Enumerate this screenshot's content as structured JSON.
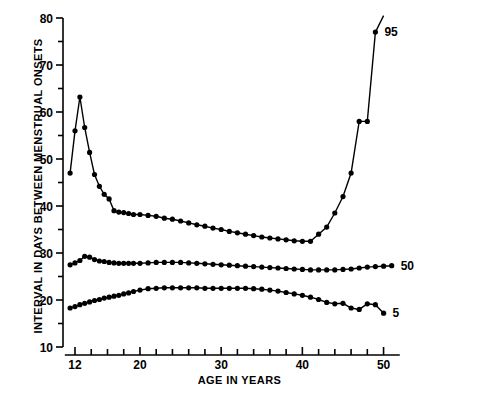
{
  "chart_data": {
    "type": "line",
    "title": "",
    "xlabel": "AGE IN YEARS",
    "ylabel": "INTERVAL IN DAYS BETWEEN MENSTRUAL ONSETS",
    "xlim": [
      10.5,
      52
    ],
    "ylim": [
      10,
      80
    ],
    "xticks": [
      12,
      14,
      16,
      18,
      20,
      22,
      24,
      26,
      28,
      30,
      32,
      34,
      36,
      38,
      40,
      42,
      44,
      46,
      48,
      50
    ],
    "xtick_labels": [
      "12",
      "",
      "",
      "",
      "20",
      "",
      "",
      "",
      "",
      "30",
      "",
      "",
      "",
      "",
      "40",
      "",
      "",
      "",
      "",
      "50"
    ],
    "yticks": [
      10,
      15,
      20,
      25,
      30,
      35,
      40,
      45,
      50,
      55,
      60,
      65,
      70,
      75,
      80
    ],
    "ytick_labels": [
      "10",
      "",
      "20",
      "",
      "30",
      "",
      "40",
      "",
      "50",
      "",
      "60",
      "",
      "70",
      "",
      "80"
    ],
    "grid": false,
    "legend_position": "right-inline-labels",
    "marker": "filled-circle",
    "line_color": "#000000",
    "series": [
      {
        "name": "95",
        "label": "95",
        "x": [
          11.4,
          12.0,
          12.6,
          13.2,
          13.8,
          14.4,
          15.0,
          15.6,
          16.2,
          16.8,
          17.4,
          18.0,
          18.6,
          19.2,
          20.0,
          21.0,
          22.0,
          23.0,
          24.0,
          25.0,
          26.0,
          27.0,
          28.0,
          29.0,
          30.0,
          31.0,
          32.0,
          33.0,
          34.0,
          35.0,
          36.0,
          37.0,
          38.0,
          39.0,
          40.0,
          41.0,
          42.0,
          43.0,
          44.0,
          45.0,
          46.0,
          47.0,
          48.0,
          49.0,
          50.0
        ],
        "values": [
          47.0,
          56.0,
          63.2,
          56.7,
          51.4,
          46.7,
          44.2,
          42.5,
          41.5,
          39.0,
          38.7,
          38.6,
          38.4,
          38.2,
          38.2,
          38.0,
          37.8,
          37.4,
          37.2,
          36.8,
          36.4,
          36.0,
          35.7,
          35.3,
          35.0,
          34.6,
          34.3,
          34.0,
          33.7,
          33.4,
          33.2,
          33.0,
          32.8,
          32.6,
          32.5,
          32.5,
          34.0,
          35.5,
          38.5,
          42.0,
          47.0,
          58.0,
          58.0,
          77.0,
          80.5
        ]
      },
      {
        "name": "50",
        "label": "50",
        "x": [
          11.4,
          12.0,
          12.6,
          13.2,
          13.8,
          14.4,
          15.0,
          15.6,
          16.2,
          16.8,
          17.4,
          18.0,
          18.6,
          19.2,
          20.0,
          21.0,
          22.0,
          23.0,
          24.0,
          25.0,
          26.0,
          27.0,
          28.0,
          29.0,
          30.0,
          31.0,
          32.0,
          33.0,
          34.0,
          35.0,
          36.0,
          37.0,
          38.0,
          39.0,
          40.0,
          41.0,
          42.0,
          43.0,
          44.0,
          45.0,
          46.0,
          47.0,
          48.0,
          49.0,
          50.0,
          51.0
        ],
        "values": [
          27.5,
          27.9,
          28.4,
          29.3,
          29.1,
          28.6,
          28.3,
          28.2,
          28.0,
          27.9,
          27.8,
          27.8,
          27.8,
          27.8,
          27.8,
          27.9,
          28.0,
          28.0,
          28.0,
          28.0,
          27.9,
          27.8,
          27.7,
          27.6,
          27.5,
          27.4,
          27.3,
          27.2,
          27.1,
          27.0,
          26.9,
          26.8,
          26.7,
          26.6,
          26.5,
          26.4,
          26.4,
          26.4,
          26.4,
          26.5,
          26.6,
          26.8,
          27.0,
          27.1,
          27.2,
          27.3
        ]
      },
      {
        "name": "5",
        "label": "5",
        "x": [
          11.4,
          12.0,
          12.6,
          13.2,
          13.8,
          14.4,
          15.0,
          15.6,
          16.2,
          16.8,
          17.4,
          18.0,
          18.6,
          19.2,
          20.0,
          21.0,
          22.0,
          23.0,
          24.0,
          25.0,
          26.0,
          27.0,
          28.0,
          29.0,
          30.0,
          31.0,
          32.0,
          33.0,
          34.0,
          35.0,
          36.0,
          37.0,
          38.0,
          39.0,
          40.0,
          41.0,
          42.0,
          43.0,
          44.0,
          45.0,
          46.0,
          47.0,
          48.0,
          49.0,
          50.0
        ],
        "values": [
          18.3,
          18.6,
          19.0,
          19.3,
          19.6,
          19.9,
          20.1,
          20.4,
          20.6,
          20.8,
          21.0,
          21.3,
          21.5,
          21.8,
          22.1,
          22.4,
          22.5,
          22.6,
          22.6,
          22.6,
          22.6,
          22.6,
          22.5,
          22.5,
          22.5,
          22.5,
          22.5,
          22.5,
          22.4,
          22.3,
          22.1,
          21.9,
          21.6,
          21.3,
          21.0,
          20.6,
          20.1,
          19.5,
          19.2,
          19.3,
          18.3,
          18.0,
          19.2,
          19.0,
          17.2
        ]
      }
    ]
  }
}
